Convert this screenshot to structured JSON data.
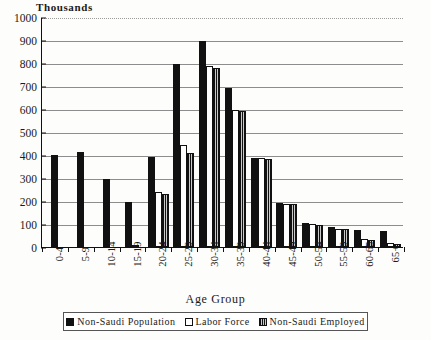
{
  "chart_data": {
    "type": "bar",
    "title": "",
    "ylabel": "Thousands",
    "xlabel": "Age Group",
    "ylim": [
      0,
      1000
    ],
    "ytick_step": 100,
    "yticks": [
      "0",
      "100",
      "200",
      "300",
      "400",
      "500",
      "600",
      "700",
      "800",
      "900",
      "1000"
    ],
    "grid": true,
    "legend_position": "bottom",
    "categories": [
      "0-4",
      "5-9",
      "10-14",
      "15-19",
      "20-24",
      "25-29",
      "30-34",
      "35-39",
      "40-44",
      "45-49",
      "50-54",
      "55-59",
      "60-65",
      "65+"
    ],
    "series": [
      {
        "name": "Non-Saudi Population",
        "color": "#111111",
        "fill": "solid-black",
        "values": [
          400,
          415,
          295,
          195,
          390,
          795,
          895,
          690,
          385,
          190,
          105,
          85,
          75,
          70
        ]
      },
      {
        "name": "Labor Force",
        "color": "#ffffff",
        "fill": "white-outline",
        "values": [
          0,
          0,
          0,
          8,
          240,
          445,
          785,
          595,
          385,
          188,
          100,
          80,
          35,
          18
        ]
      },
      {
        "name": "Non-Saudi Employed",
        "color": "#c9c9c9",
        "fill": "gray-hatched",
        "values": [
          0,
          0,
          0,
          0,
          230,
          410,
          780,
          590,
          382,
          185,
          95,
          78,
          32,
          15
        ]
      }
    ]
  },
  "legend": {
    "items": [
      {
        "label": "Non-Saudi Population",
        "swatch": "solid-black-swatch"
      },
      {
        "label": "Labor Force",
        "swatch": "white-outline-swatch"
      },
      {
        "label": "Non-Saudi Employed",
        "swatch": "gray-hatched-swatch"
      }
    ]
  }
}
